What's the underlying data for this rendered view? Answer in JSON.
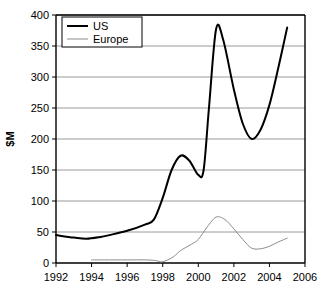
{
  "chart_data": {
    "type": "line",
    "title": "",
    "xlabel": "",
    "ylabel": "$M",
    "xlim": [
      1992,
      2006
    ],
    "ylim": [
      0,
      400
    ],
    "xticks": [
      "1992",
      "1994",
      "1996",
      "1998",
      "2000",
      "2002",
      "2004",
      "2006"
    ],
    "xtick_values": [
      1992,
      1994,
      1996,
      1998,
      2000,
      2002,
      2004,
      2006
    ],
    "yticks": [
      "0",
      "50",
      "100",
      "150",
      "200",
      "250",
      "300",
      "350",
      "400"
    ],
    "ytick_values": [
      0,
      50,
      100,
      150,
      200,
      250,
      300,
      350,
      400
    ],
    "grid": "horizontal",
    "legend_position": "top-left",
    "series": [
      {
        "name": "US",
        "color": "#000000",
        "width": 2,
        "x": [
          1992,
          1993,
          1993.7,
          1994.5,
          1995,
          1996,
          1997,
          1997.5,
          1998,
          1998.5,
          1999,
          1999.5,
          2000,
          2000.3,
          2000.6,
          2001,
          2001.4,
          2002,
          2002.5,
          2003,
          2003.5,
          2004,
          2004.5,
          2005
        ],
        "values": [
          45,
          41,
          39,
          42,
          45,
          52,
          62,
          70,
          105,
          150,
          173,
          165,
          142,
          150,
          250,
          377,
          360,
          280,
          225,
          200,
          215,
          255,
          315,
          380
        ]
      },
      {
        "name": "Europe",
        "color": "#8c8c8c",
        "width": 1,
        "x": [
          1994,
          1995,
          1996,
          1997,
          1997.6,
          1998,
          1998.6,
          1999,
          1999.6,
          2000,
          2000.5,
          2001,
          2001.5,
          2002,
          2002.5,
          2003,
          2003.5,
          2004,
          2004.5,
          2005
        ],
        "values": [
          5,
          5,
          5,
          5,
          4,
          2,
          10,
          20,
          30,
          38,
          58,
          74,
          70,
          55,
          38,
          24,
          23,
          27,
          34,
          40
        ]
      }
    ]
  },
  "legend": {
    "items": [
      {
        "label": "US",
        "color": "#000000"
      },
      {
        "label": "Europe",
        "color": "#8c8c8c"
      }
    ]
  }
}
